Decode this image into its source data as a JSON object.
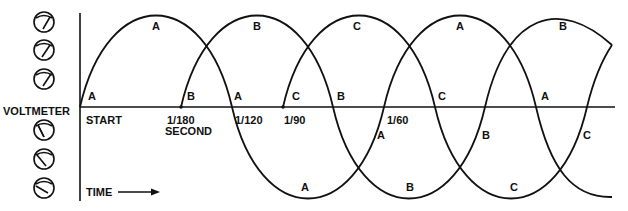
{
  "left_panel": {
    "label": "VOLTMETER",
    "meters_above": 3,
    "meters_below": 3
  },
  "axis": {
    "start_label": "START",
    "time_label": "TIME",
    "time_arrow": "arrow-right"
  },
  "ticks": [
    {
      "id": "t180",
      "line1": "1/180",
      "line2": "SECOND"
    },
    {
      "id": "t120",
      "line1": "1/120"
    },
    {
      "id": "t90",
      "line1": "1/90"
    },
    {
      "id": "t60",
      "line1": "1/60"
    }
  ],
  "waves": [
    {
      "name": "A",
      "start_offset": "0"
    },
    {
      "name": "B",
      "start_offset": "1/180 second"
    },
    {
      "name": "C",
      "start_offset": "1/90 second"
    }
  ],
  "wave_labels": {
    "a_start": "A",
    "a_peak1": "A",
    "a_zero1": "A",
    "a_trough1": "A",
    "a_cross2": "A",
    "a_peak2": "A",
    "a_zero3": "A",
    "b_start": "B",
    "b_peak1": "B",
    "b_zero1": "B",
    "b_trough1": "B",
    "b_cross2": "B",
    "b_peak2": "B",
    "c_start": "C",
    "c_peak1": "C",
    "c_zero1": "C",
    "c_trough1": "C",
    "c_cross2": "C"
  },
  "colors": {
    "line": "#111111",
    "background": "#ffffff"
  }
}
